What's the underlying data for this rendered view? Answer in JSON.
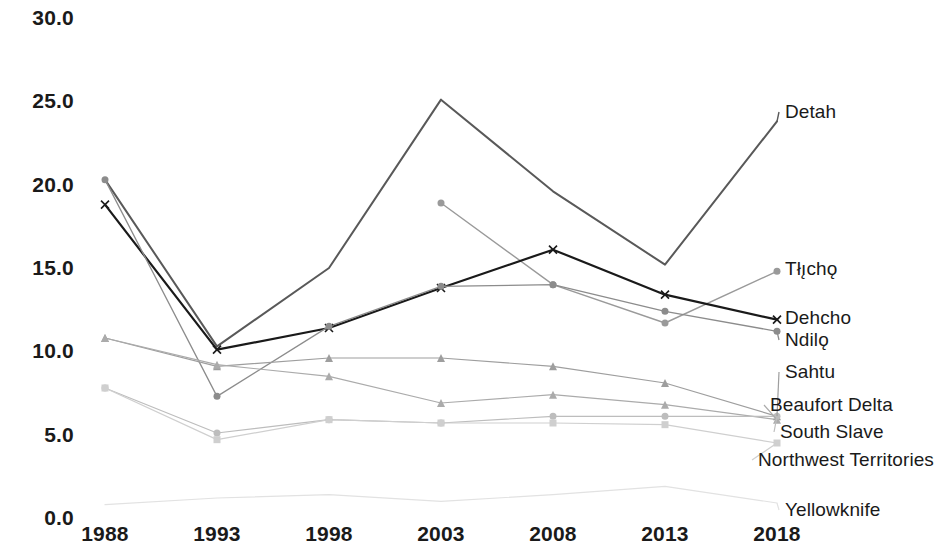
{
  "chart_data": {
    "type": "line",
    "title": "",
    "subtitle": "",
    "xlabel": "",
    "ylabel": "",
    "x": [
      1988,
      1993,
      1998,
      2003,
      2008,
      2013,
      2018
    ],
    "categories": [
      "1988",
      "1993",
      "1998",
      "2003",
      "2008",
      "2013",
      "2018"
    ],
    "xtick_labels": [
      "1988",
      "1993",
      "1998",
      "2003",
      "2008",
      "2013",
      "2018"
    ],
    "ytick_labels": [
      "0.0",
      "5.0",
      "10.0",
      "15.0",
      "20.0",
      "25.0",
      "30.0"
    ],
    "ylim": [
      0.0,
      30.0
    ],
    "ytick_step": 5.0,
    "grid": false,
    "legend_position": "right-inline-labels",
    "series": [
      {
        "name": "Detah",
        "values": [
          20.3,
          10.3,
          15.0,
          25.1,
          19.6,
          15.2,
          23.8
        ],
        "color": "#595959",
        "marker": "none",
        "width": 2.0,
        "label_y_value": 23.8
      },
      {
        "name": "Tłı̨chǫ",
        "values": [
          null,
          null,
          null,
          18.9,
          14.0,
          11.7,
          14.8
        ],
        "color": "#9a9a9a",
        "marker": "circle",
        "width": 1.4,
        "label_y_value": 14.8
      },
      {
        "name": "Dehcho",
        "values": [
          18.8,
          10.1,
          11.4,
          13.8,
          16.1,
          13.4,
          11.9
        ],
        "color": "#1a1a1a",
        "marker": "x",
        "width": 2.2,
        "label_y_value": 11.9
      },
      {
        "name": "Ndilǫ",
        "values": [
          20.3,
          7.3,
          11.5,
          13.9,
          14.0,
          12.4,
          11.2
        ],
        "color": "#8c8c8c",
        "marker": "circle",
        "width": 1.3,
        "label_y_value": 11.2
      },
      {
        "name": "Sahtu",
        "values": [
          10.8,
          9.1,
          9.6,
          9.6,
          9.1,
          8.1,
          6.1
        ],
        "color": "#9e9e9e",
        "marker": "triangle",
        "width": 1.2,
        "label_y_value": 9.0
      },
      {
        "name": "Beaufort Delta",
        "values": [
          10.8,
          9.2,
          8.5,
          6.9,
          7.4,
          6.8,
          5.9
        ],
        "color": "#ababab",
        "marker": "triangle",
        "width": 1.2,
        "label_y_value": 7.2
      },
      {
        "name": "South Slave",
        "values": [
          7.8,
          5.1,
          5.9,
          5.7,
          6.1,
          6.1,
          6.1
        ],
        "color": "#bdbdbd",
        "marker": "circle",
        "width": 1.2,
        "label_y_value": 5.6
      },
      {
        "name": "Northwest Territories",
        "values": [
          7.8,
          4.7,
          5.9,
          5.7,
          5.7,
          5.6,
          4.5
        ],
        "color": "#cfcfcf",
        "marker": "square",
        "width": 1.2,
        "label_y_value": 4.4
      },
      {
        "name": "Yellowknife",
        "values": [
          0.8,
          1.2,
          1.4,
          1.0,
          1.4,
          1.9,
          0.9
        ],
        "color": "#e2e2e2",
        "marker": "none",
        "width": 1.2,
        "label_y_value": 1.0
      }
    ],
    "series_labels": [
      {
        "name": "Detah",
        "x": 785,
        "y": 112
      },
      {
        "name": "Tłı̨chǫ",
        "x": 785,
        "y": 269
      },
      {
        "name": "Dehcho",
        "x": 785,
        "y": 318
      },
      {
        "name": "Ndilǫ",
        "x": 785,
        "y": 340
      },
      {
        "name": "Sahtu",
        "x": 785,
        "y": 372
      },
      {
        "name": "Beaufort Delta",
        "x": 770,
        "y": 405
      },
      {
        "name": "South Slave",
        "x": 780,
        "y": 432
      },
      {
        "name": "Northwest Territories",
        "x": 758,
        "y": 460
      },
      {
        "name": "Yellowknife",
        "x": 785,
        "y": 510
      }
    ],
    "axis_geometry": {
      "x_positions": [
        105,
        217,
        329,
        441,
        553,
        665,
        777
      ],
      "y_zero_px": 518,
      "y_top_px": 18,
      "y_max_value": 30.0
    }
  }
}
